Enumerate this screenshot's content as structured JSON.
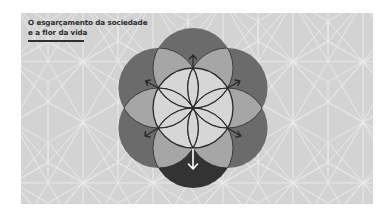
{
  "title": {
    "line1": "O esgarçamento da sociedade",
    "line2": "e a flor da vida"
  },
  "diagram": {
    "name": "flower-of-life",
    "center": [
      172,
      95
    ],
    "radius": 40,
    "petal_angles_deg": [
      -90,
      -30,
      30,
      90,
      150,
      210
    ],
    "arrows": [
      {
        "direction": "up",
        "color": "dark"
      },
      {
        "direction": "up-right",
        "color": "dark"
      },
      {
        "direction": "down-right",
        "color": "dark"
      },
      {
        "direction": "down",
        "color": "white"
      },
      {
        "direction": "down-left",
        "color": "dark"
      },
      {
        "direction": "up-left",
        "color": "dark"
      }
    ]
  },
  "colors": {
    "panel_bg": "#d3d3d3",
    "pattern_line": "#ececec",
    "outer_circle": "#6b6b6b",
    "bottom_circle": "#333333",
    "lens": "#a6a6a6",
    "center": "#d6d6d6",
    "stroke": "#2a2a2a",
    "title": "#2e2e2e"
  }
}
